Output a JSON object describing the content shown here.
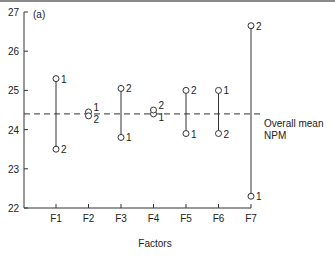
{
  "chart_data": {
    "type": "scatter",
    "panel_label": "(a)",
    "title": "",
    "xlabel": "Factors",
    "ylabel": "",
    "ylim": [
      22,
      27
    ],
    "yticks": [
      22,
      23,
      24,
      25,
      26,
      27
    ],
    "categories": [
      "F1",
      "F2",
      "F3",
      "F4",
      "F5",
      "F6",
      "F7"
    ],
    "grid": false,
    "series": [
      {
        "name": "Level 1",
        "values": [
          25.3,
          24.45,
          23.8,
          24.4,
          23.9,
          25.0,
          22.3
        ]
      },
      {
        "name": "Level 2",
        "values": [
          23.5,
          24.35,
          25.05,
          24.5,
          25.0,
          23.9,
          26.65
        ]
      }
    ],
    "reference_line": {
      "label_line1": "Overall mean",
      "label_line2": "NPM",
      "value": 24.4,
      "style": "dashed"
    }
  }
}
